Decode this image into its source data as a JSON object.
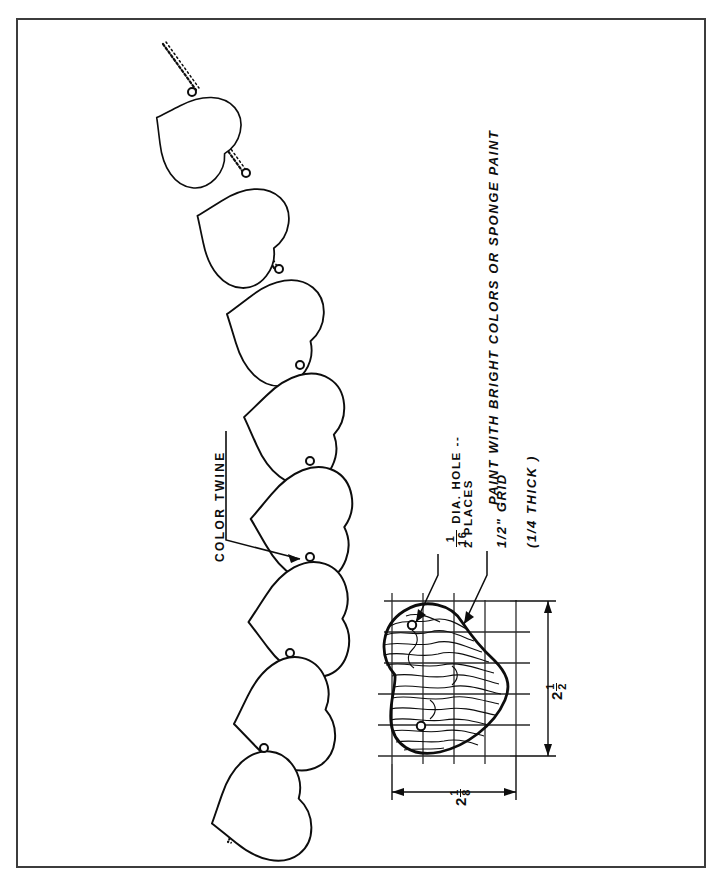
{
  "sheet": {
    "border_color": "#3c3c3c",
    "background": "#ffffff",
    "ink_color": "#0d0d0d",
    "orientation_note": "all lettering rotated 90 degrees (reads bottom-to-top)"
  },
  "notes": {
    "paint_note": "PAINT WITH BRIGHT COLORS OR SPONGE PAINT",
    "color_twine_label": "COLOR TWINE",
    "hole_note_line1": "DIA. HOLE --",
    "hole_note_line2": "2 PLACES",
    "hole_fraction_numerator": "1",
    "hole_fraction_denominator": "16",
    "grid_note": "1/2\" GRID",
    "thickness_note": "(1/4 THICK )"
  },
  "dimensions": {
    "height": {
      "whole": "2",
      "numerator": "1",
      "denominator": "2",
      "display": "2 1/2"
    },
    "width": {
      "whole": "2",
      "numerator": "1",
      "denominator": "8",
      "display": "2 1/8"
    }
  },
  "garland": {
    "heart_count": 8,
    "twine_segments": 9,
    "description": "string of die-cut hearts threaded on twisted twine"
  },
  "pattern_detail": {
    "grid_spacing_note": "1/2\" GRID",
    "grid_columns": 5,
    "grid_rows": 6,
    "hole_count": 2,
    "texture": "wood grain"
  }
}
